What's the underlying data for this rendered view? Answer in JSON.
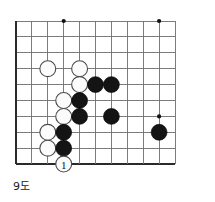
{
  "figure": {
    "kind": "go-board-diagram",
    "caption": "9도",
    "caption_meaning_label": "9도"
  },
  "board": {
    "origin_x": 16,
    "origin_y": 21,
    "spacing": 15.9,
    "cols": 11,
    "rows": 10,
    "left_edge_thick": true,
    "top_edge_thick": false,
    "bottom_edge_thick": true,
    "right_edge_thick": false,
    "line_color": "#6e6e6e",
    "edge_color": "#2b2b2b",
    "background_color": "#ffffff"
  },
  "star_points": [
    {
      "col": 3,
      "row": 0
    },
    {
      "col": 9,
      "row": 0
    },
    {
      "col": 9,
      "row": 6
    }
  ],
  "stones": [
    {
      "color": "white",
      "col": 2,
      "row": 3
    },
    {
      "color": "white",
      "col": 4,
      "row": 3
    },
    {
      "color": "white",
      "col": 4,
      "row": 4
    },
    {
      "color": "white",
      "col": 3,
      "row": 5
    },
    {
      "color": "white",
      "col": 3,
      "row": 6
    },
    {
      "color": "white",
      "col": 2,
      "row": 7
    },
    {
      "color": "white",
      "col": 2,
      "row": 8
    },
    {
      "color": "black",
      "col": 5,
      "row": 4
    },
    {
      "color": "black",
      "col": 6,
      "row": 4
    },
    {
      "color": "black",
      "col": 4,
      "row": 5
    },
    {
      "color": "black",
      "col": 4,
      "row": 6
    },
    {
      "color": "black",
      "col": 6,
      "row": 6
    },
    {
      "color": "black",
      "col": 9,
      "row": 7
    },
    {
      "color": "black",
      "col": 3,
      "row": 7
    },
    {
      "color": "black",
      "col": 3,
      "row": 8
    }
  ],
  "move_stones": [
    {
      "color": "white",
      "col": 3,
      "row": 9,
      "label": "1"
    }
  ],
  "colors": {
    "black_stone": "#141414",
    "white_stone": "#fbfbfb",
    "white_stone_border": "#4a4a4a",
    "grid": "#6e6e6e",
    "edge": "#2b2b2b",
    "text": "#1a1a1a"
  }
}
